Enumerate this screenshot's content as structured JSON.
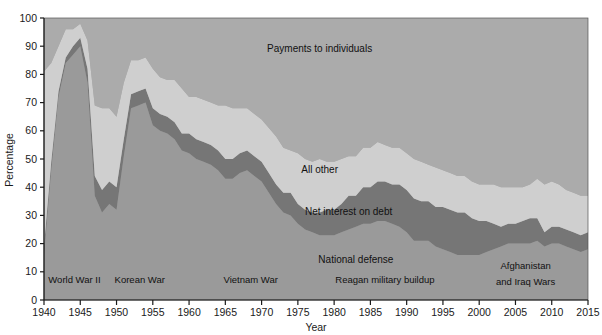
{
  "chart_data": {
    "type": "area",
    "stacked": true,
    "title": "",
    "xlabel": "Year",
    "ylabel": "Percentage",
    "xlim": [
      1940,
      2015
    ],
    "ylim": [
      0,
      100
    ],
    "grid": false,
    "legend_position": "in-plot annotations",
    "x_ticks": [
      1940,
      1945,
      1950,
      1955,
      1960,
      1965,
      1970,
      1975,
      1980,
      1985,
      1990,
      1995,
      2000,
      2005,
      2010,
      2015
    ],
    "y_ticks": [
      0,
      10,
      20,
      30,
      40,
      50,
      60,
      70,
      80,
      90,
      100
    ],
    "x": [
      1940,
      1941,
      1942,
      1943,
      1944,
      1945,
      1946,
      1947,
      1948,
      1949,
      1950,
      1951,
      1952,
      1953,
      1954,
      1955,
      1956,
      1957,
      1958,
      1959,
      1960,
      1961,
      1962,
      1963,
      1964,
      1965,
      1966,
      1967,
      1968,
      1969,
      1970,
      1971,
      1972,
      1973,
      1974,
      1975,
      1976,
      1977,
      1978,
      1979,
      1980,
      1981,
      1982,
      1983,
      1984,
      1985,
      1986,
      1987,
      1988,
      1989,
      1990,
      1991,
      1992,
      1993,
      1994,
      1995,
      1996,
      1997,
      1998,
      1999,
      2000,
      2001,
      2002,
      2003,
      2004,
      2005,
      2006,
      2007,
      2008,
      2009,
      2010,
      2011,
      2012,
      2013,
      2014,
      2015
    ],
    "series": [
      {
        "name": "National defense",
        "color": "#9a9a9a",
        "label_x": 1983,
        "label_y": 13,
        "values": [
          16,
          46,
          72,
          84,
          87,
          90,
          77,
          37,
          31,
          34,
          32,
          51,
          68,
          69,
          70,
          62,
          60,
          59,
          57,
          53,
          52,
          50,
          49,
          48,
          46,
          43,
          43,
          45,
          46,
          44,
          42,
          38,
          34,
          31,
          30,
          27,
          25,
          24,
          23,
          23,
          23,
          24,
          25,
          26,
          27,
          27,
          28,
          28,
          27,
          26,
          24,
          21,
          21,
          21,
          19,
          18,
          17,
          16,
          16,
          16,
          16,
          17,
          18,
          19,
          20,
          20,
          20,
          20,
          21,
          19,
          20,
          20,
          19,
          18,
          17,
          18
        ]
      },
      {
        "name": "Net interest on debt",
        "color": "#767676",
        "label_x": 1982,
        "label_y": 30,
        "values": [
          3,
          3,
          2,
          2,
          3,
          3,
          5,
          7,
          8,
          8,
          8,
          6,
          5,
          5,
          5,
          6,
          6,
          6,
          6,
          6,
          7,
          7,
          7,
          7,
          7,
          7,
          7,
          7,
          7,
          7,
          7,
          7,
          7,
          7,
          8,
          7,
          7,
          7,
          8,
          9,
          9,
          10,
          12,
          11,
          13,
          13,
          14,
          14,
          14,
          15,
          15,
          15,
          14,
          14,
          14,
          15,
          15,
          15,
          15,
          13,
          12,
          11,
          9,
          7,
          7,
          7,
          8,
          9,
          8,
          5,
          6,
          6,
          6,
          6,
          6,
          6
        ]
      },
      {
        "name": "All other",
        "color": "#cfcfcf",
        "label_x": 1978,
        "label_y": 45,
        "values": [
          62,
          35,
          16,
          10,
          6,
          5,
          10,
          25,
          29,
          26,
          25,
          20,
          12,
          11,
          11,
          14,
          13,
          13,
          15,
          16,
          13,
          15,
          15,
          15,
          16,
          19,
          18,
          16,
          15,
          15,
          15,
          16,
          17,
          16,
          15,
          18,
          18,
          18,
          19,
          17,
          17,
          16,
          14,
          14,
          14,
          14,
          14,
          13,
          13,
          13,
          13,
          14,
          14,
          13,
          14,
          13,
          13,
          13,
          13,
          13,
          13,
          13,
          14,
          14,
          13,
          13,
          12,
          12,
          14,
          17,
          16,
          15,
          14,
          14,
          14,
          13
        ]
      },
      {
        "name": "Payments to individuals",
        "color": "#ababab",
        "label_x": 1978,
        "label_y": 88,
        "values": [
          19,
          16,
          10,
          4,
          4,
          2,
          8,
          31,
          32,
          32,
          35,
          23,
          15,
          15,
          14,
          18,
          21,
          22,
          22,
          25,
          28,
          28,
          29,
          30,
          31,
          31,
          32,
          32,
          32,
          34,
          36,
          39,
          42,
          46,
          47,
          48,
          50,
          51,
          50,
          51,
          51,
          50,
          49,
          49,
          46,
          46,
          44,
          45,
          46,
          46,
          48,
          50,
          51,
          52,
          53,
          54,
          55,
          56,
          56,
          58,
          59,
          59,
          59,
          60,
          60,
          60,
          60,
          59,
          57,
          59,
          58,
          59,
          61,
          62,
          63,
          63
        ]
      }
    ],
    "annotations": [
      {
        "id": "world-war-ii",
        "text": "World War II",
        "x": 1944.2,
        "y": 6
      },
      {
        "id": "korean-war",
        "text": "Korean War",
        "x": 1953.2,
        "y": 6
      },
      {
        "id": "vietnam-war",
        "text": "Vietnam War",
        "x": 1968.5,
        "y": 6
      },
      {
        "id": "reagan-military-buildup",
        "text": "Reagan military buildup",
        "x": 1987.0,
        "y": 6
      },
      {
        "id": "afghanistan-and-iraq-wars-line1",
        "text": "Afghanistan",
        "x": 2006.4,
        "y": 11
      },
      {
        "id": "afghanistan-and-iraq-wars-line2",
        "text": "and Iraq Wars",
        "x": 2006.4,
        "y": 5.2
      }
    ]
  },
  "style": {
    "plot_background": "#ababab",
    "page_background": "#ffffff",
    "axis_color": "#1a1a1a",
    "text_color": "#111111"
  }
}
